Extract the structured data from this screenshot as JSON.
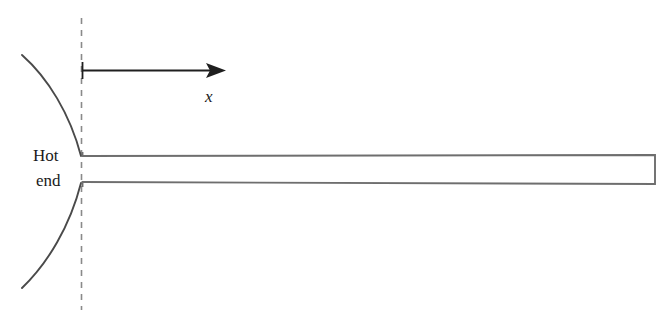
{
  "figure": {
    "width": 668,
    "height": 326,
    "background_color": "#ffffff"
  },
  "labels": {
    "hot_end_line1": "Hot",
    "hot_end_line2": "end",
    "axis_x": "x"
  },
  "icons": {
    "arrow": "arrow-right-icon",
    "dashed_line": "dashed-reference-line-icon",
    "upper_arc": "curved-arc-icon",
    "lower_arc": "curved-arc-icon"
  },
  "colors": {
    "stroke_dark": "#3a3a3a",
    "stroke_bar": "#6e6e6e",
    "stroke_dashed": "#8a8a8a",
    "text": "#1a1a1a",
    "background": "#ffffff"
  },
  "geometry": {
    "dashed_line_x": 81,
    "dashed_line_top_y": 18,
    "dashed_line_bottom_y": 310,
    "dash_length": 6,
    "dash_gap": 6,
    "arrow_start_x": 82,
    "arrow_end_x": 226,
    "arrow_y": 70,
    "arrow_tick_top_y": 62,
    "arrow_tick_bottom_y": 79,
    "bar_left_x": 82,
    "bar_right_x": 655,
    "bar_left_top_y": 156,
    "bar_left_bottom_y": 182,
    "bar_right_top_y": 155,
    "bar_right_bottom_y": 184,
    "upper_arc_start": [
      22,
      55
    ],
    "upper_arc_end": [
      81,
      156
    ],
    "lower_arc_start": [
      81,
      183
    ],
    "lower_arc_end": [
      22,
      288
    ]
  }
}
